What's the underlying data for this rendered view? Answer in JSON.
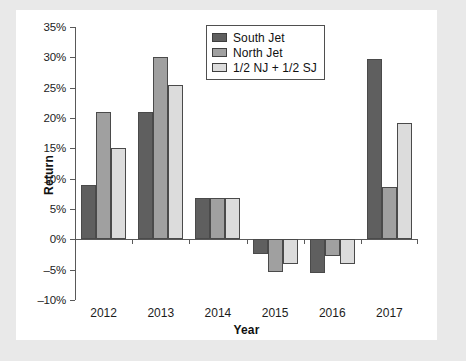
{
  "chart_data": {
    "type": "bar",
    "title": "",
    "xlabel": "Year",
    "ylabel": "Return",
    "categories": [
      "2012",
      "2013",
      "2014",
      "2015",
      "2016",
      "2017"
    ],
    "ylim": [
      -10,
      35
    ],
    "ytick_values": [
      35,
      30,
      25,
      20,
      15,
      10,
      5,
      0,
      -5,
      -10
    ],
    "ytick_labels": [
      "35%",
      "30%",
      "25%",
      "20%",
      "15%",
      "10%",
      "5%",
      "0%",
      "-5%",
      "-10%"
    ],
    "grid": false,
    "legend_position": "top-center",
    "series": [
      {
        "name": "South Jet",
        "color": "#5f5f5f",
        "values": [
          9.0,
          21.0,
          6.8,
          -2.5,
          -5.5,
          29.7
        ]
      },
      {
        "name": "North Jet",
        "color": "#a0a0a0",
        "values": [
          21.0,
          30.0,
          6.8,
          -5.4,
          -2.7,
          8.7
        ]
      },
      {
        "name": "1/2 NJ + 1/2 SJ",
        "color": "#dcdcdc",
        "values": [
          15.0,
          25.4,
          6.8,
          -4.0,
          -4.1,
          19.2
        ]
      }
    ]
  },
  "legend": {
    "items": [
      {
        "label": "South Jet",
        "color": "#5f5f5f"
      },
      {
        "label": "North Jet",
        "color": "#a0a0a0"
      },
      {
        "label": "1/2 NJ + 1/2 SJ",
        "color": "#dcdcdc"
      }
    ]
  },
  "colors": {
    "page_background": "#e9e9e9",
    "panel_background": "#ffffff",
    "axis": "#595959",
    "text": "#1c1c1c"
  }
}
